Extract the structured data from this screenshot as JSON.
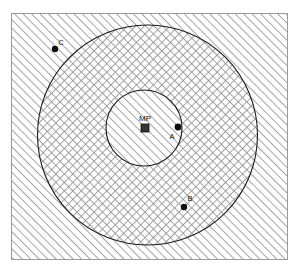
{
  "figure": {
    "frame": {
      "x": 11,
      "y": 13,
      "width": 277,
      "height": 247,
      "border_color": "#9a9a9a"
    },
    "background_color": "#ffffff",
    "stroke_color": "#1a1a1a",
    "hatch_color": "#8d8d8d"
  },
  "regions": [
    {
      "name": "outer-zone",
      "label": "",
      "fill_pattern": "diagonal-hatch",
      "pattern_direction": "forward-slash",
      "shape": "rectangle-minus-circle"
    },
    {
      "name": "middle-zone",
      "label": "",
      "fill_pattern": "cross-hatch",
      "pattern_direction": "both",
      "shape": "annulus"
    },
    {
      "name": "inner-zone",
      "label": "",
      "fill_pattern": "diagonal-hatch",
      "pattern_direction": "forward-slash",
      "shape": "circle"
    }
  ],
  "circles": [
    {
      "name": "outer-circle",
      "cx": 147.5,
      "cy": 135,
      "r": 110
    },
    {
      "name": "inner-circle",
      "cx": 144,
      "cy": 128,
      "r": 38
    }
  ],
  "center_marker": {
    "name": "mp-marker",
    "label": "MP",
    "shape": "square",
    "x": 145,
    "y": 128,
    "size": 8,
    "color": "#333333",
    "label_x": 145,
    "label_y": 121
  },
  "points": [
    {
      "id": "A",
      "label": "A",
      "x": 178,
      "y": 127,
      "label_x": 172,
      "label_y": 139,
      "zone": "inner-zone-edge"
    },
    {
      "id": "B",
      "label": "B",
      "x": 184,
      "y": 207,
      "label_x": 190,
      "label_y": 201,
      "zone": "middle-zone"
    },
    {
      "id": "C",
      "label": "C",
      "x": 55,
      "y": 49,
      "label_x": 61,
      "label_y": 45,
      "zone": "outer-zone"
    }
  ]
}
